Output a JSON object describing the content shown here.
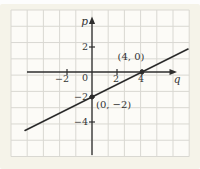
{
  "figure": {
    "colors": {
      "background": "#f5f3e9",
      "plot_background": "#fcfbf7",
      "grid": "#d9d8d2",
      "axis": "#2e2e2e",
      "line": "#2b2b2b",
      "text": "#333333"
    },
    "labels": {
      "y_axis": "p",
      "x_axis": "q",
      "origin": "0",
      "x_tick_m2": "−2",
      "x_tick_p2": "2",
      "x_tick_p4": "4",
      "y_tick_p2": "2",
      "y_tick_m2": "−2",
      "y_tick_m4": "−4",
      "point_a": "(4, 0)",
      "point_b": "(0, −2)"
    }
  },
  "chart_data": {
    "type": "line",
    "title": "",
    "xlabel": "q",
    "ylabel": "p",
    "xlim": [
      -5.4,
      7.7
    ],
    "ylim": [
      -4.7,
      4.3
    ],
    "grid": true,
    "x_ticks": [
      -2,
      0,
      2,
      4
    ],
    "y_ticks": [
      2,
      -2,
      -4
    ],
    "series": [
      {
        "name": "line through (0, −2) and (4, 0)",
        "slope": 0.5,
        "intercept": -2,
        "x": [
          -5.36,
          7.68
        ],
        "y": [
          -4.68,
          1.84
        ],
        "marked_points": [
          {
            "q": 4,
            "p": 0,
            "label": "(4, 0)"
          },
          {
            "q": 0,
            "p": -2,
            "label": "(0, −2)"
          }
        ]
      }
    ]
  }
}
